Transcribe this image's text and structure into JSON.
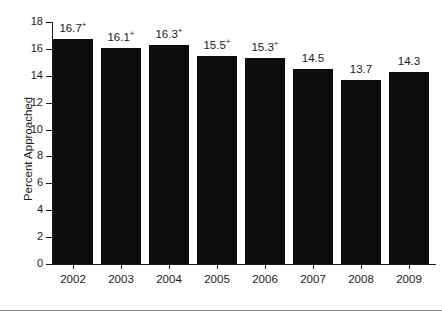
{
  "chart_data": {
    "type": "bar",
    "title": "",
    "xlabel": "",
    "ylabel": "Percent Approached",
    "ylim": [
      0,
      18
    ],
    "ytick_step": 2,
    "grid": false,
    "legend": null,
    "bar_color": "#0d0d0d",
    "axis_color": "#1a1a1a",
    "categories": [
      "2002",
      "2003",
      "2004",
      "2005",
      "2006",
      "2007",
      "2008",
      "2009"
    ],
    "values": [
      16.7,
      16.1,
      16.3,
      15.5,
      15.3,
      14.5,
      13.7,
      14.3
    ],
    "value_labels": [
      "16.7",
      "16.1",
      "16.3",
      "15.5",
      "15.3",
      "14.5",
      "13.7",
      "14.3"
    ],
    "value_label_markers": [
      "+",
      "+",
      "+",
      "+",
      "+",
      "",
      "",
      ""
    ],
    "ytick_labels": [
      "18",
      "16",
      "14",
      "12",
      "10",
      "8",
      "6",
      "4",
      "2",
      "0"
    ],
    "ytick_values": [
      18,
      16,
      14,
      12,
      10,
      8,
      6,
      4,
      2,
      0
    ],
    "annotations": {
      "marker_symbol": "+",
      "marker_note": "superscript plus on 2002-2006 values"
    }
  },
  "footer": {
    "rule_color": "#8a8a8a"
  }
}
